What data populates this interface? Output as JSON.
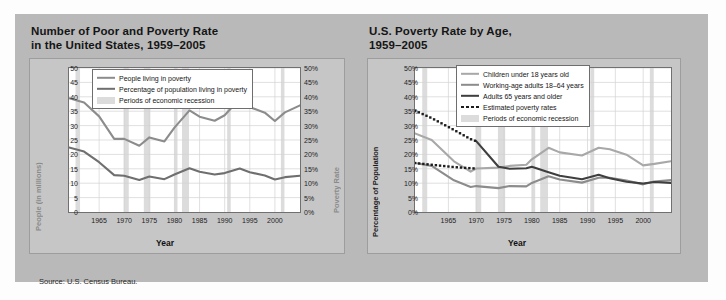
{
  "source_note": "Source: U.S. Census Bureau.",
  "colors": {
    "panel_bg": "#b9b9b9",
    "plot_bg": "#c6c6c6",
    "canvas_bg": "#ffffff",
    "recession_band": "#dcdcdc",
    "gridline": "#d2d2d2",
    "series_light": "#a8a8a8",
    "series_mid": "#8c8c8c",
    "series_dark": "#3f3f3f",
    "estimated_dots": "#1c1c1c",
    "axis_label_muted": "#8a8a8a",
    "text": "#151515"
  },
  "left_chart": {
    "title_line1": "Number of Poor and Poverty Rate",
    "title_line2": "in the United States, 1959–2005",
    "legend": [
      {
        "label": "People living in poverty",
        "style": "line",
        "color": "#8c8c8c"
      },
      {
        "label": "Percentage of population living in poverty",
        "style": "line",
        "color": "#6f6f6f"
      },
      {
        "label": "Periods of economic recession",
        "style": "band",
        "color": "#dcdcdc"
      }
    ]
  },
  "right_chart": {
    "title_line1": "U.S. Poverty Rate by Age,",
    "title_line2": "1959–2005",
    "legend": [
      {
        "label": "Children under 18 years old",
        "style": "line",
        "color": "#a8a8a8"
      },
      {
        "label": "Working-age adults 18–64 years",
        "style": "line",
        "color": "#8c8c8c"
      },
      {
        "label": "Adults 65 years and older",
        "style": "line",
        "color": "#3f3f3f"
      },
      {
        "label": "Estimated poverty rates",
        "style": "dotted",
        "color": "#1c1c1c"
      },
      {
        "label": "Periods of economic recession",
        "style": "band",
        "color": "#dcdcdc"
      }
    ]
  },
  "chart_data": [
    {
      "type": "line",
      "id": "number-of-poor-and-poverty-rate",
      "title": "Number of Poor and Poverty Rate in the United States, 1959–2005",
      "xlabel": "Year",
      "ylabel": "People (in millions)",
      "ylabel_right": "Poverty Rate",
      "xlim": [
        1959,
        2005
      ],
      "ylim": [
        0,
        50
      ],
      "ylim_right": [
        0,
        50
      ],
      "grid": true,
      "legend_position": "top-center-inside",
      "xticks": [
        1965,
        1970,
        1975,
        1980,
        1985,
        1990,
        1995,
        2000
      ],
      "yticks": [
        0,
        5,
        10,
        15,
        20,
        25,
        30,
        35,
        40,
        45,
        50
      ],
      "yticklabels_right": [
        "0%",
        "5%",
        "10%",
        "15%",
        "20%",
        "25%",
        "30%",
        "35%",
        "40%",
        "45%",
        "50%"
      ],
      "x": [
        1959,
        1962,
        1965,
        1968,
        1970,
        1973,
        1975,
        1978,
        1980,
        1983,
        1985,
        1988,
        1990,
        1993,
        1995,
        1998,
        2000,
        2002,
        2005
      ],
      "series": [
        {
          "name": "People living in poverty",
          "units": "millions",
          "axis": "left",
          "color": "#8c8c8c",
          "values": [
            39.5,
            38.0,
            33.2,
            25.4,
            25.4,
            23.0,
            25.9,
            24.5,
            29.3,
            35.3,
            33.1,
            31.7,
            33.6,
            39.3,
            36.4,
            34.5,
            31.6,
            34.6,
            37.0
          ]
        },
        {
          "name": "Percentage of population living in poverty",
          "units": "percent",
          "axis": "right",
          "color": "#6f6f6f",
          "values": [
            22.4,
            21.0,
            17.3,
            12.8,
            12.6,
            11.1,
            12.3,
            11.4,
            13.0,
            15.2,
            14.0,
            13.0,
            13.5,
            15.1,
            13.8,
            12.7,
            11.3,
            12.1,
            12.6
          ]
        }
      ],
      "recessions": [
        [
          1960.3,
          1961.2
        ],
        [
          1969.9,
          1970.9
        ],
        [
          1973.9,
          1975.2
        ],
        [
          1980.0,
          1980.6
        ],
        [
          1981.5,
          1982.9
        ],
        [
          1990.5,
          1991.2
        ],
        [
          2001.2,
          2001.9
        ]
      ]
    },
    {
      "type": "line",
      "id": "us-poverty-rate-by-age",
      "title": "U.S. Poverty Rate by Age, 1959–2005",
      "xlabel": "Year",
      "ylabel": "Percentage of Population",
      "xlim": [
        1959,
        2005
      ],
      "ylim": [
        0,
        50
      ],
      "grid": true,
      "legend_position": "top-right-inside",
      "xticks": [
        1965,
        1970,
        1975,
        1980,
        1985,
        1990,
        1995,
        2000
      ],
      "yticks": [
        0,
        5,
        10,
        15,
        20,
        25,
        30,
        35,
        40,
        45,
        50
      ],
      "yticklabels": [
        "0%",
        "5%",
        "10%",
        "15%",
        "20%",
        "25%",
        "30%",
        "35%",
        "40%",
        "45%",
        "50%"
      ],
      "series": [
        {
          "name": "Children under 18 years old",
          "color": "#a8a8a8",
          "style": "solid",
          "x": [
            1959,
            1962,
            1966,
            1969,
            1970,
            1974,
            1976,
            1979,
            1980,
            1983,
            1985,
            1989,
            1992,
            1994,
            1997,
            2000,
            2002,
            2005
          ],
          "values": [
            27.3,
            25.0,
            17.6,
            14.0,
            15.1,
            15.4,
            16.0,
            16.4,
            18.3,
            22.3,
            20.7,
            19.6,
            22.3,
            21.8,
            19.9,
            16.2,
            16.7,
            17.6
          ]
        },
        {
          "name": "Working-age adults 18–64 years",
          "color": "#8c8c8c",
          "style": "solid",
          "x": [
            1959,
            1962,
            1966,
            1969,
            1970,
            1974,
            1976,
            1979,
            1980,
            1983,
            1985,
            1989,
            1992,
            1994,
            1997,
            2000,
            2002,
            2005
          ],
          "values": [
            17.0,
            16.0,
            11.0,
            8.7,
            9.0,
            8.3,
            9.0,
            8.9,
            10.1,
            12.4,
            11.3,
            10.2,
            11.9,
            11.9,
            10.9,
            9.6,
            10.6,
            11.1
          ]
        },
        {
          "name": "Adults 65 years and older",
          "color": "#3f3f3f",
          "style": "solid",
          "x": [
            1970,
            1974,
            1976,
            1979,
            1980,
            1983,
            1985,
            1989,
            1992,
            1994,
            1997,
            2000,
            2002,
            2005
          ],
          "values": [
            24.6,
            15.7,
            15.0,
            15.2,
            15.7,
            13.8,
            12.6,
            11.4,
            12.9,
            11.7,
            10.5,
            9.9,
            10.4,
            10.1
          ]
        },
        {
          "name": "Estimated poverty rates — adults 65 and older",
          "color": "#1c1c1c",
          "style": "dotted",
          "x": [
            1959,
            1962,
            1966,
            1969,
            1970
          ],
          "values": [
            35.2,
            32.6,
            28.5,
            25.3,
            24.6
          ]
        },
        {
          "name": "Estimated poverty rates — children under 18",
          "color": "#1c1c1c",
          "style": "dotted",
          "x": [
            1959,
            1962,
            1966,
            1969,
            1970
          ],
          "values": [
            17.0,
            16.4,
            15.6,
            15.2,
            15.1
          ]
        }
      ],
      "recessions": [
        [
          1960.3,
          1961.2
        ],
        [
          1969.9,
          1970.9
        ],
        [
          1973.9,
          1975.2
        ],
        [
          1980.0,
          1980.6
        ],
        [
          1981.5,
          1982.9
        ],
        [
          1990.5,
          1991.2
        ],
        [
          2001.2,
          2001.9
        ]
      ]
    }
  ]
}
